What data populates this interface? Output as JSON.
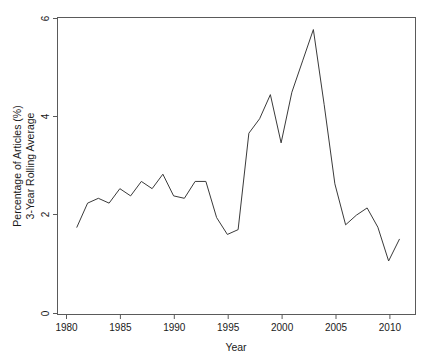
{
  "chart_data": {
    "type": "line",
    "title": "",
    "xlabel": "Year",
    "ylabel": "Percentage of Articles (%)\n3-Year Rolling Average",
    "ylabel_line1": "Percentage of Articles (%)",
    "ylabel_line2": "3-Year Rolling Average",
    "xlim": [
      1979.2,
      2012.5
    ],
    "ylim": [
      -0.06,
      6.1
    ],
    "xticks": [
      1980,
      1985,
      1990,
      1995,
      2000,
      2005,
      2010
    ],
    "xtick_labels": [
      "1980",
      "1985",
      "1990",
      "1995",
      "2000",
      "2005",
      "2010"
    ],
    "yticks": [
      0,
      2,
      4,
      6
    ],
    "ytick_labels": [
      "0",
      "2",
      "4",
      "6"
    ],
    "grid": false,
    "legend": null,
    "line_color": "#3a3a3a",
    "frame_color": "#5a5a5a",
    "series": [
      {
        "name": "3-Year Rolling Average",
        "x": [
          1981,
          1982,
          1983,
          1984,
          1985,
          1986,
          1987,
          1988,
          1989,
          1990,
          1991,
          1992,
          1993,
          1994,
          1995,
          1996,
          1997,
          1998,
          1999,
          2000,
          2001,
          2002,
          2003,
          2004,
          2005,
          2006,
          2007,
          2008,
          2009,
          2010,
          2011
        ],
        "values": [
          1.75,
          2.25,
          2.35,
          2.25,
          2.55,
          2.4,
          2.7,
          2.55,
          2.85,
          2.4,
          2.35,
          2.7,
          2.7,
          1.95,
          1.6,
          1.7,
          3.7,
          4.0,
          4.5,
          3.5,
          4.55,
          5.2,
          5.85,
          4.3,
          2.65,
          1.8,
          2.0,
          2.15,
          1.75,
          1.05,
          1.5
        ]
      }
    ]
  },
  "axis": {
    "x_title": "Year",
    "y_title_line1": "Percentage of Articles (%)",
    "y_title_line2": "3-Year Rolling Average"
  }
}
